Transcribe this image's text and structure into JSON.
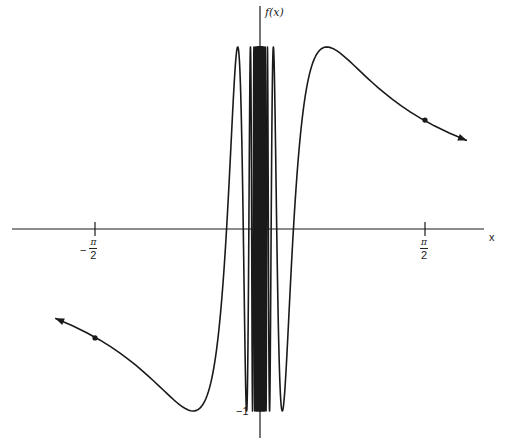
{
  "chart_data": {
    "type": "line",
    "title": "",
    "function": "f(x) = sin(1/x)",
    "xlabel": "x",
    "ylabel": "f(x)",
    "x_ticks": [
      {
        "value": -1.5708,
        "label": "-π/2"
      },
      {
        "value": 1.5708,
        "label": "π/2"
      }
    ],
    "y_ticks": [
      {
        "value": -1,
        "label": "-1"
      }
    ],
    "xlim": [
      -2.4,
      2.3
    ],
    "ylim": [
      -1.05,
      1.05
    ],
    "highlighted_points": [
      {
        "x": -1.5708,
        "y": -0.5985
      },
      {
        "x": 1.5708,
        "y": 0.5985
      }
    ],
    "arrows": [
      "left end",
      "right end"
    ],
    "grid": false,
    "legend": null,
    "color": "#1a1a1a"
  },
  "labels": {
    "y_axis": "f(x)",
    "x_axis": "x",
    "neg_sign": "−",
    "pi": "π",
    "two": "2",
    "minus_one": "−1"
  }
}
